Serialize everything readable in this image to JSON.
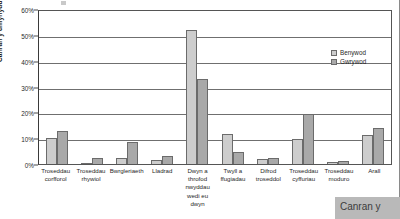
{
  "chart_data": {
    "type": "bar",
    "title": "",
    "xlabel": "",
    "ylabel": "Canran y diffynyddion",
    "ylim": [
      0,
      60
    ],
    "ytick_labels": [
      "0%",
      "10%",
      "20%",
      "30%",
      "40%",
      "50%",
      "60%"
    ],
    "ytick_values": [
      0,
      10,
      20,
      30,
      40,
      50,
      60
    ],
    "grid": true,
    "legend_position": "upper-right",
    "categories": [
      "Troseddau corfforol",
      "Troseddau rhywiol",
      "Bwrgleriaeth",
      "Lladrad",
      "Dwyn a throfod nwyddau wedi eu dwyn",
      "Twyll a ffugiadau",
      "Difrod troseddol",
      "Troseddau cyffuriau",
      "Troseddau moduro",
      "Arall"
    ],
    "series": [
      {
        "name": "Benywod",
        "color": "#cdcdcd",
        "values": [
          10.0,
          0.4,
          2.5,
          1.7,
          52.0,
          11.7,
          1.9,
          9.6,
          0.7,
          11.2
        ]
      },
      {
        "name": "Gwrywod",
        "color": "#a9a9a9",
        "values": [
          12.7,
          2.2,
          8.4,
          3.1,
          33.0,
          4.6,
          2.3,
          19.5,
          1.2,
          14.0
        ]
      }
    ]
  },
  "axis": {
    "y_title": "Canran y diffynyddion"
  },
  "category_labels": [
    [
      "Troseddau",
      "corfforol"
    ],
    [
      "Troseddau",
      "rhywiol"
    ],
    [
      "Bwrgleriaeth"
    ],
    [
      "Lladrad"
    ],
    [
      "Dwyn a",
      "throfod",
      "nwyddau",
      "wedi eu",
      "dwyn"
    ],
    [
      "Twyll a",
      "ffugiadau"
    ],
    [
      "Difrod",
      "troseddol"
    ],
    [
      "Troseddau",
      "cyffuriau"
    ],
    [
      "Troseddau",
      "moduro"
    ],
    [
      "Arall"
    ]
  ],
  "legend": {
    "items": [
      {
        "label": "Benywod",
        "color": "#cdcdcd"
      },
      {
        "label": "Gwrywod",
        "color": "#a9a9a9"
      }
    ]
  },
  "overlay": {
    "text": "Canran y"
  }
}
